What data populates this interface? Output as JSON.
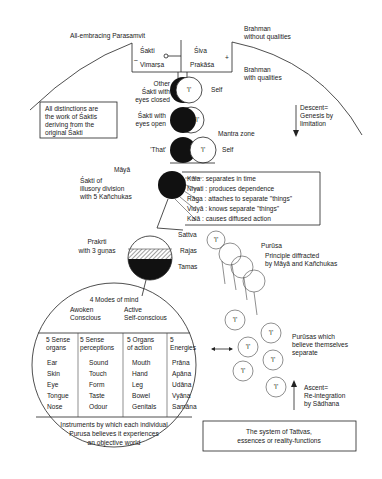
{
  "top": {
    "parasamvit": "All-embracing Parasamvit",
    "brahman_without": [
      "Brahman",
      "without qualities"
    ],
    "brahman_with": [
      "Brahman",
      "with qualities"
    ],
    "sakti": "Śakti",
    "vimarsa": "Vimarṣa",
    "siva": "Śiva",
    "prakasa": "Prakāśa",
    "minus": "–",
    "plus": "+"
  },
  "stages": {
    "other_sakti": [
      "Other",
      "Śakti with",
      "eyes closed"
    ],
    "sakti_open": [
      "Śakti with",
      "eyes open"
    ],
    "that": "'That'",
    "self1": "Self",
    "self2": "Self",
    "mantra_zone": "Mantra zone",
    "I": "'I'"
  },
  "distinctions_box": [
    "All distinctions are",
    "the work of Śaktis",
    "deriving from the",
    "original Śakti"
  ],
  "descent": [
    "Descent=",
    "Genesis by",
    "limitation"
  ],
  "maya": {
    "title": "Māyā",
    "desc": [
      "Śakti of",
      "illusory division",
      "with 5 Kañchukas"
    ],
    "kanchukas": [
      "Kāla : separates in time",
      "Niyati : produces dependence",
      "Rāga : attaches to separate \"things\"",
      "Vidyā : knows separate \"things\"",
      "Kalā : causes diffused action"
    ]
  },
  "prakrti": {
    "label": [
      "Prakrti",
      "with 3 guṇas"
    ],
    "gunas": [
      "Sattva",
      "Rajas",
      "Tamas"
    ]
  },
  "purusa": {
    "title": "Purūsa",
    "desc": [
      "Principle diffracted",
      "by Māyā and Kañchukas"
    ],
    "separate": [
      "Purūsas which",
      "believe themselves",
      "separate"
    ]
  },
  "mind": {
    "title": "4 Modes of mind",
    "modes": [
      [
        "Awoken",
        "Conscious"
      ],
      [
        "Active",
        "Self-conscious"
      ]
    ],
    "columns": [
      {
        "header": [
          "5 Sense",
          "organs"
        ],
        "items": [
          "Ear",
          "Skin",
          "Eye",
          "Tongue",
          "Nose"
        ]
      },
      {
        "header": [
          "5 Sense",
          "perceptions"
        ],
        "items": [
          "Sound",
          "Touch",
          "Form",
          "Taste",
          "Odour"
        ]
      },
      {
        "header": [
          "5 Organs",
          "of action"
        ],
        "items": [
          "Mouth",
          "Hand",
          "Leg",
          "Bowel",
          "Genitals"
        ]
      },
      {
        "header": [
          "5",
          "Energies"
        ],
        "items": [
          "Prāna",
          "Apāna",
          "Udāna",
          "Vyāna",
          "Samāna"
        ]
      }
    ],
    "footer": [
      "Instruments by which each individual",
      "Purusa believes it experiences",
      "an objective world"
    ]
  },
  "ascent": [
    "Ascent=",
    "Re-integration",
    "by Sādhana"
  ],
  "caption": [
    "The system of Tattvas,",
    "essences or reality-functions"
  ],
  "colors": {
    "ink": "#1a1a1a",
    "paper": "#ffffff",
    "hatch": "#555555"
  }
}
